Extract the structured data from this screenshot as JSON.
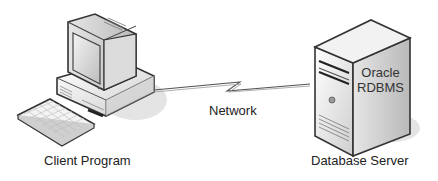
{
  "diagram": {
    "type": "client-server architecture",
    "nodes": [
      {
        "id": "client",
        "label": "Client Program",
        "icon": "desktop-computer-icon"
      },
      {
        "id": "server",
        "label": "Database Server",
        "icon": "tower-server-icon",
        "inner_label_line1": "Oracle",
        "inner_label_line2": "RDBMS"
      }
    ],
    "edges": [
      {
        "from": "client",
        "to": "server",
        "label": "Network",
        "style": "lightning-bolt"
      }
    ]
  },
  "client": {
    "label": "Client Program"
  },
  "server": {
    "label": "Database Server",
    "line1": "Oracle",
    "line2": "RDBMS"
  },
  "network": {
    "label": "Network"
  },
  "colors": {
    "outline": "#333333",
    "fill_light": "#eeeeee",
    "fill_mid": "#d6d6d6",
    "shadow": "#e4e4e4"
  }
}
